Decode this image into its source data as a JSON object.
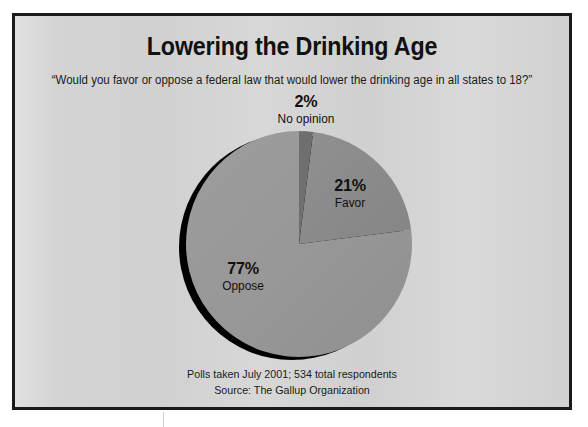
{
  "figure": {
    "title": "Lowering the Drinking Age",
    "subtitle": "“Would you favor or oppose a federal law that would lower the drinking age in all states to 18?”",
    "footnote_line1": "Polls taken July 2001; 534 total respondents",
    "footnote_line2": "Source: The Gallup Organization"
  },
  "labels": {
    "no_opinion": {
      "pct": "2%",
      "name": "No opinion"
    },
    "favor": {
      "pct": "21%",
      "name": "Favor"
    },
    "oppose": {
      "pct": "77%",
      "name": "Oppose"
    }
  },
  "colors": {
    "page_background": "#ffffff",
    "card_background": "#d3d3d3",
    "frame": "#1a1a1a",
    "text": "#111111",
    "slice_no_opinion": "#6f6f6f",
    "slice_favor": "#8a8a8a",
    "slice_oppose": "#979797",
    "pie_shadow": "#000000"
  },
  "chart_data": {
    "type": "pie",
    "title": "Lowering the Drinking Age",
    "subtitle": "“Would you favor or oppose a federal law that would lower the drinking age in all states to 18?”",
    "categories": [
      "No opinion",
      "Favor",
      "Oppose"
    ],
    "values": [
      2,
      21,
      77
    ],
    "unit": "percent",
    "total_respondents": 534,
    "source": "The Gallup Organization",
    "poll_date": "July 2001",
    "legend": "none",
    "labels_inline": true,
    "start_angle_deg": -90,
    "direction": "clockwise",
    "slice_colors": [
      "#6f6f6f",
      "#8a8a8a",
      "#979797"
    ],
    "slices": [
      {
        "name": "No opinion",
        "value": 2,
        "label": "2%",
        "color": "#6f6f6f"
      },
      {
        "name": "Favor",
        "value": 21,
        "label": "21%",
        "color": "#8a8a8a"
      },
      {
        "name": "Oppose",
        "value": 77,
        "label": "77%",
        "color": "#979797"
      }
    ]
  }
}
